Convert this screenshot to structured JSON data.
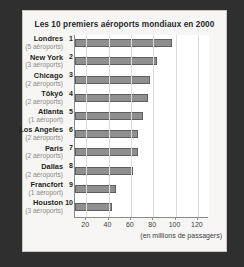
{
  "chart_data": {
    "type": "bar",
    "orientation": "horizontal",
    "title": "Les 10 premiers aéroports mondiaux en 2000",
    "xlabel": "(en millions de passagers)",
    "ylabel": "",
    "xlim": [
      10,
      130
    ],
    "xticks": [
      20,
      40,
      60,
      80,
      100,
      120
    ],
    "xticklabels": [
      "20",
      "40",
      "60",
      "80",
      "100",
      "120"
    ],
    "grid": "vertical",
    "legend": "none",
    "categories": [
      "Londres",
      "New York",
      "Chicago",
      "Tōkyō",
      "Atlanta",
      "Los Angeles",
      "Paris",
      "Dallas",
      "Francfort",
      "Houston"
    ],
    "values": [
      97,
      83,
      77,
      75,
      71,
      66,
      66,
      62,
      47,
      43
    ],
    "ranks": [
      1,
      2,
      3,
      4,
      5,
      6,
      7,
      8,
      9,
      10
    ],
    "sublabels": [
      "(5 aéroports)",
      "(3 aéroports)",
      "(2 aéroports)",
      "(2 aéroports)",
      "(1 aéroport)",
      "(2 aéroports)",
      "(2 aéroports)",
      "(2 aéroports)",
      "(1 aéroport)",
      "(3 aéroports)"
    ],
    "bar_color": "#8f8f8f",
    "bar_edge_color": "#5e5e5e",
    "grid_color": "#dedcd8",
    "background_color": "#f7f6f4"
  }
}
